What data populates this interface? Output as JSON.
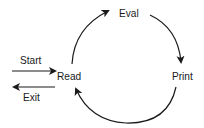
{
  "diagram": {
    "nodes": {
      "read": "Read",
      "eval": "Eval",
      "print": "Print"
    },
    "entry_label": "Start",
    "exit_label": "Exit",
    "edges": [
      {
        "from": "Start",
        "to": "Read"
      },
      {
        "from": "Read",
        "to": "Eval"
      },
      {
        "from": "Eval",
        "to": "Print"
      },
      {
        "from": "Print",
        "to": "Read"
      },
      {
        "from": "Read",
        "to": "Exit"
      }
    ],
    "colors": {
      "stroke": "#1a1a1a",
      "background": "#ffffff"
    }
  }
}
